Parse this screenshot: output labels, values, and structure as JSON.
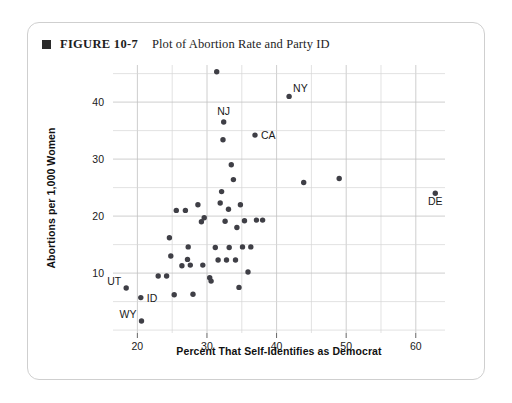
{
  "figure": {
    "bullet_icon": "square-bullet-icon",
    "number": "FIGURE 10-7",
    "title": "Plot of Abortion Rate and Party ID"
  },
  "chart_data": {
    "type": "scatter",
    "title": "Plot of Abortion Rate and Party ID",
    "xlabel": "Percent That Self-Identifies as Democrat",
    "ylabel": "Abortions per 1,000 Women",
    "xlim": [
      16.5,
      64.2
    ],
    "ylim": [
      -0.5,
      46.5
    ],
    "xticks": [
      20,
      30,
      40,
      50,
      60
    ],
    "yticks": [
      10,
      20,
      30,
      40
    ],
    "grid": true,
    "grid_x_step": 5,
    "grid_y_step": 5,
    "legend": "none",
    "marker_color": "#3f3f46",
    "points": [
      {
        "x": 18.4,
        "y": 7.4,
        "label": "UT",
        "label_pos": "left"
      },
      {
        "x": 20.5,
        "y": 5.7,
        "label": "ID",
        "label_pos": "right"
      },
      {
        "x": 20.6,
        "y": 1.6,
        "label": "WY",
        "label_pos": "left"
      },
      {
        "x": 23.0,
        "y": 9.5,
        "label": ""
      },
      {
        "x": 24.2,
        "y": 9.5,
        "label": ""
      },
      {
        "x": 24.6,
        "y": 16.2,
        "label": ""
      },
      {
        "x": 24.8,
        "y": 13.0,
        "label": ""
      },
      {
        "x": 25.3,
        "y": 6.2,
        "label": ""
      },
      {
        "x": 25.6,
        "y": 21.0,
        "label": ""
      },
      {
        "x": 26.4,
        "y": 11.3,
        "label": ""
      },
      {
        "x": 26.9,
        "y": 21.0,
        "label": ""
      },
      {
        "x": 27.2,
        "y": 12.4,
        "label": ""
      },
      {
        "x": 27.3,
        "y": 14.6,
        "label": ""
      },
      {
        "x": 27.6,
        "y": 11.4,
        "label": ""
      },
      {
        "x": 28.0,
        "y": 6.3,
        "label": ""
      },
      {
        "x": 28.7,
        "y": 22.0,
        "label": ""
      },
      {
        "x": 29.2,
        "y": 19.0,
        "label": ""
      },
      {
        "x": 29.4,
        "y": 11.4,
        "label": ""
      },
      {
        "x": 29.6,
        "y": 19.7,
        "label": ""
      },
      {
        "x": 30.4,
        "y": 9.2,
        "label": ""
      },
      {
        "x": 30.6,
        "y": 8.6,
        "label": ""
      },
      {
        "x": 31.2,
        "y": 14.5,
        "label": ""
      },
      {
        "x": 31.4,
        "y": 45.3,
        "label": ""
      },
      {
        "x": 31.6,
        "y": 12.3,
        "label": ""
      },
      {
        "x": 31.9,
        "y": 22.3,
        "label": ""
      },
      {
        "x": 32.1,
        "y": 24.3,
        "label": ""
      },
      {
        "x": 32.3,
        "y": 33.4,
        "label": ""
      },
      {
        "x": 32.4,
        "y": 36.5,
        "label": "NJ",
        "label_pos": "above"
      },
      {
        "x": 32.6,
        "y": 19.1,
        "label": ""
      },
      {
        "x": 32.8,
        "y": 12.3,
        "label": ""
      },
      {
        "x": 33.1,
        "y": 21.2,
        "label": ""
      },
      {
        "x": 33.2,
        "y": 14.5,
        "label": ""
      },
      {
        "x": 33.5,
        "y": 29.0,
        "label": ""
      },
      {
        "x": 33.8,
        "y": 26.4,
        "label": ""
      },
      {
        "x": 34.1,
        "y": 12.3,
        "label": ""
      },
      {
        "x": 34.3,
        "y": 18.0,
        "label": ""
      },
      {
        "x": 34.6,
        "y": 7.5,
        "label": ""
      },
      {
        "x": 34.8,
        "y": 22.0,
        "label": ""
      },
      {
        "x": 35.1,
        "y": 14.6,
        "label": ""
      },
      {
        "x": 35.4,
        "y": 19.2,
        "label": ""
      },
      {
        "x": 35.9,
        "y": 10.2,
        "label": ""
      },
      {
        "x": 36.3,
        "y": 14.6,
        "label": ""
      },
      {
        "x": 36.9,
        "y": 34.2,
        "label": "CA",
        "label_pos": "right"
      },
      {
        "x": 37.1,
        "y": 19.3,
        "label": ""
      },
      {
        "x": 38.0,
        "y": 19.3,
        "label": ""
      },
      {
        "x": 41.8,
        "y": 41.0,
        "label": "NY",
        "label_pos": "upright"
      },
      {
        "x": 43.9,
        "y": 25.9,
        "label": ""
      },
      {
        "x": 49.0,
        "y": 26.6,
        "label": ""
      },
      {
        "x": 62.8,
        "y": 24.0,
        "label": "DE",
        "label_pos": "below"
      }
    ]
  }
}
